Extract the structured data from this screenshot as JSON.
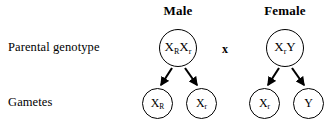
{
  "diagram": {
    "title_row_labels": {
      "parental": "Parental genotype",
      "gametes": "Gametes"
    },
    "columns": [
      {
        "header": "Male"
      },
      {
        "header": "Female"
      }
    ],
    "cross_symbol": "x",
    "parents": [
      {
        "sex": "male",
        "allele1_base": "X",
        "allele1_sub": "R",
        "allele2_base": "X",
        "allele2_sub": "r"
      },
      {
        "sex": "female",
        "allele1_base": "X",
        "allele1_sub": "r",
        "allele2_base": "Y",
        "allele2_sub": ""
      }
    ],
    "gametes": [
      {
        "parent": "male",
        "base": "X",
        "sub": "R"
      },
      {
        "parent": "male",
        "base": "X",
        "sub": "r"
      },
      {
        "parent": "female",
        "base": "X",
        "sub": "r"
      },
      {
        "parent": "female",
        "base": "Y",
        "sub": ""
      }
    ],
    "colors": {
      "background": "#ffffff",
      "stroke": "#000000",
      "text": "#000000"
    }
  }
}
